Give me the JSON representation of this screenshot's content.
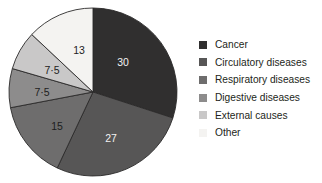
{
  "chart_data": {
    "type": "pie",
    "title": "",
    "subtitle": "",
    "xlabel": "",
    "ylabel": "",
    "legend_position": "right",
    "grid": false,
    "start_angle_deg": 0,
    "direction": "clockwise",
    "total": 100,
    "categories": [
      "Cancer",
      "Circulatory diseases",
      "Respiratory diseases",
      "Digestive diseases",
      "External causes",
      "Other"
    ],
    "values": [
      30,
      27,
      15,
      7.5,
      7.5,
      13
    ],
    "value_labels": [
      "30",
      "27",
      "15",
      "7·5",
      "7·5",
      "13"
    ],
    "colors": [
      "#302f2f",
      "#575656",
      "#6e6d6d",
      "#8d8c8c",
      "#c9c8c8",
      "#f4f3f1"
    ],
    "label_text_colors": [
      "#f2f2f2",
      "#f2f2f2",
      "#1d1d1d",
      "#1d1d1d",
      "#1d1d1d",
      "#1d1d1d"
    ],
    "slice_border_color": "#2b2a2a"
  },
  "pie": {
    "center_x": 93,
    "center_y": 92,
    "radius": 84,
    "slices": [
      {
        "label": "30",
        "value": 30,
        "color": "#302f2f",
        "text_color": "#f2f2f2",
        "label_x": 123,
        "label_y": 63
      },
      {
        "label": "27",
        "value": 27,
        "color": "#575656",
        "text_color": "#f2f2f2",
        "label_x": 111,
        "label_y": 139
      },
      {
        "label": "15",
        "value": 15,
        "color": "#6e6d6d",
        "text_color": "#1d1d1d",
        "label_x": 57,
        "label_y": 127
      },
      {
        "label": "7·5",
        "value": 7.5,
        "color": "#8d8c8c",
        "text_color": "#1d1d1d",
        "label_x": 42,
        "label_y": 93
      },
      {
        "label": "7·5",
        "value": 7.5,
        "color": "#c9c8c8",
        "text_color": "#1d1d1d",
        "label_x": 52,
        "label_y": 71
      },
      {
        "label": "13",
        "value": 13,
        "color": "#f4f3f1",
        "text_color": "#1d1d1d",
        "label_x": 79,
        "label_y": 51
      }
    ]
  },
  "legend": {
    "items": [
      {
        "label": "Cancer",
        "color": "#302f2f"
      },
      {
        "label": "Circulatory diseases",
        "color": "#575656"
      },
      {
        "label": "Respiratory diseases",
        "color": "#6e6d6d"
      },
      {
        "label": "Digestive diseases",
        "color": "#8d8c8c"
      },
      {
        "label": "External causes",
        "color": "#c9c8c8"
      },
      {
        "label": "Other",
        "color": "#f4f3f1"
      }
    ]
  }
}
